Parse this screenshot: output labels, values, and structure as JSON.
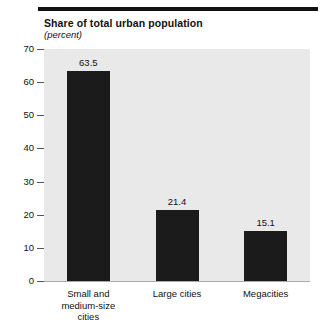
{
  "chart_data": {
    "type": "bar",
    "title": "Share of total urban population",
    "subtitle": "(percent)",
    "xlabel": "",
    "ylabel": "",
    "categories": [
      "Small and medium-size cities",
      "Large cities",
      "Megacities"
    ],
    "values": [
      63.5,
      21.4,
      15.1
    ],
    "value_labels": [
      "63.5",
      "21.4",
      "15.1"
    ],
    "ylim": [
      0,
      70
    ],
    "yticks": [
      0,
      10,
      20,
      30,
      40,
      50,
      60,
      70
    ],
    "ytick_labels": [
      "0",
      "10",
      "20",
      "30",
      "40",
      "50",
      "60",
      "70"
    ],
    "grid": false,
    "legend": null,
    "bar_color": "#1b1b1b",
    "plot_background": "#e9e9e9",
    "page_background": "#ffffff",
    "category_label_lines": [
      [
        "Small and",
        "medium-size",
        "cities"
      ],
      [
        "Large cities"
      ],
      [
        "Megacities"
      ]
    ]
  }
}
